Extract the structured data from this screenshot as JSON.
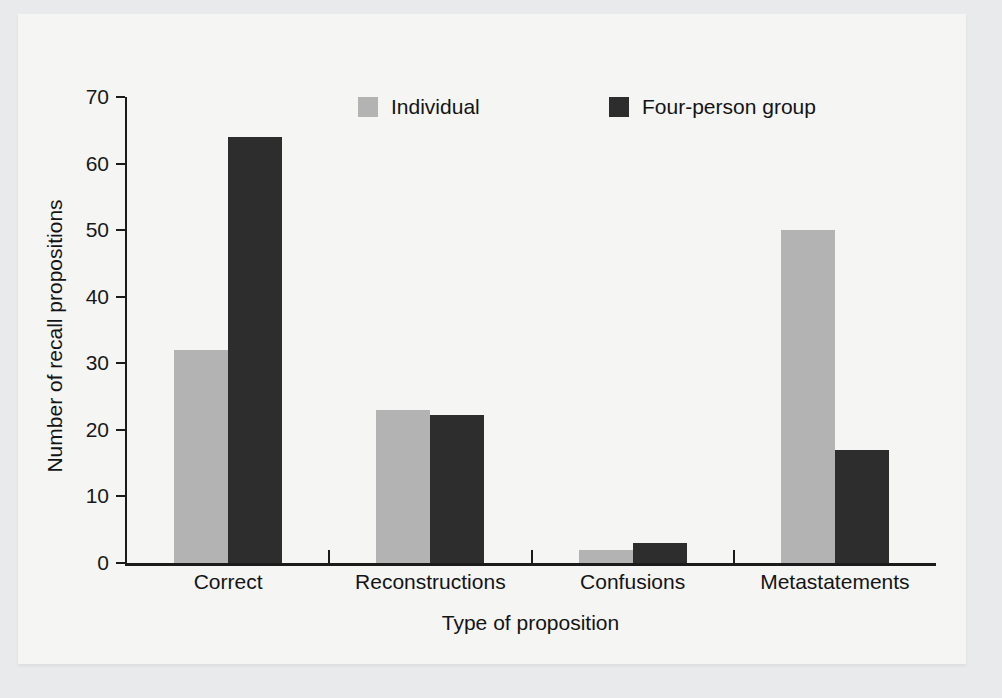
{
  "chart_data": {
    "type": "bar",
    "title": "",
    "subtitle": "",
    "xlabel": "Type of proposition",
    "ylabel": "Number of recall propositions",
    "categories": [
      "Correct",
      "Reconstructions",
      "Confusions",
      "Metastatements"
    ],
    "series": [
      {
        "name": "Individual",
        "color": "#b3b3b3",
        "values": [
          32,
          23,
          2,
          50
        ]
      },
      {
        "name": "Four-person group",
        "color": "#2d2d2d",
        "values": [
          64,
          22.3,
          3,
          17
        ]
      }
    ],
    "ylim": [
      0,
      70
    ],
    "yticks": [
      0,
      10,
      20,
      30,
      40,
      50,
      60,
      70
    ],
    "ytick_labels": [
      "0",
      "10",
      "20",
      "30",
      "40",
      "50",
      "60",
      "70"
    ],
    "grid": false,
    "legend_position": "top-center",
    "background_color": "#f5f5f4",
    "axis_color": "#1b1b1b"
  }
}
